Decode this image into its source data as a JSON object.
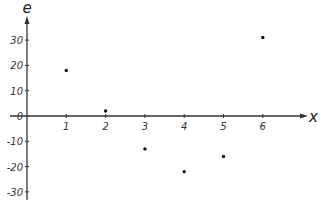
{
  "chart_data": {
    "type": "scatter",
    "title": "",
    "xlabel": "x",
    "ylabel": "e",
    "x": [
      1,
      2,
      3,
      4,
      5,
      6
    ],
    "values": [
      18,
      2,
      -13,
      -22,
      -16,
      31
    ],
    "x_ticks": [
      "1",
      "2",
      "3",
      "4",
      "5",
      "6"
    ],
    "y_ticks": [
      "30",
      "20",
      "10",
      "0",
      "-10",
      "-20",
      "-30"
    ],
    "xlim": [
      0,
      7.2
    ],
    "ylim": [
      -32,
      36
    ],
    "grid": false,
    "legend": null
  },
  "colors": {
    "axis": "#333333",
    "point": "#111111",
    "background": "#ffffff"
  }
}
